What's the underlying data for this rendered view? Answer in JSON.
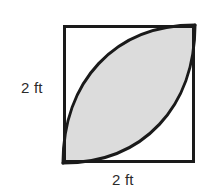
{
  "figure": {
    "kind": "geometry-diagram",
    "background_color": "#ffffff",
    "square": {
      "name": "outer-square",
      "x": 63,
      "y": 25,
      "width": 132,
      "height": 138,
      "stroke_color": "#1a1a1a",
      "stroke_width": 3,
      "fill_color": "#ffffff"
    },
    "lens": {
      "name": "shaded-lens",
      "fill_color": "#dcdcdc",
      "stroke_color": "#1a1a1a",
      "stroke_width": 3,
      "from_corner": "bottom-left",
      "to_corner": "top-right"
    },
    "labels": {
      "left": {
        "text": "2 ft",
        "position": "left-of-square",
        "color": "#2b2b2b"
      },
      "bottom": {
        "text": "2 ft",
        "position": "below-square",
        "color": "#2b2b2b"
      }
    }
  }
}
